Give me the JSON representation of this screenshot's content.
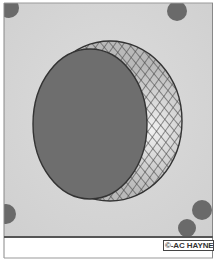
{
  "figure": {
    "colors": {
      "panel": "#d6d6d6",
      "panel_edge": "#e4e4e4",
      "disc": "#6e6e6e",
      "disc_outline": "#333333",
      "hatch_fill": "#c9c9c9",
      "hatch_lines": "#4a4a4a",
      "markers": "#6a6a6a",
      "frame": "#888888",
      "base_line": "#555555",
      "footer": "#ffffff"
    },
    "outer_circle": {
      "cx": 110,
      "cy": 121,
      "rx": 72,
      "ry": 80
    },
    "dark_disc": {
      "cx": 90,
      "cy": 124,
      "rx": 57,
      "ry": 75
    },
    "markers": [
      {
        "name": "top-left",
        "cx": 9,
        "cy": 8,
        "r": 10
      },
      {
        "name": "top-right",
        "cx": 177,
        "cy": 11,
        "r": 10
      },
      {
        "name": "left-lower",
        "cx": 6,
        "cy": 214,
        "r": 10
      },
      {
        "name": "right-lower",
        "cx": 202,
        "cy": 210,
        "r": 10
      },
      {
        "name": "bottom-right",
        "cx": 187,
        "cy": 228,
        "r": 9
      }
    ]
  },
  "credit": {
    "label": "©-AC HAYNES"
  }
}
